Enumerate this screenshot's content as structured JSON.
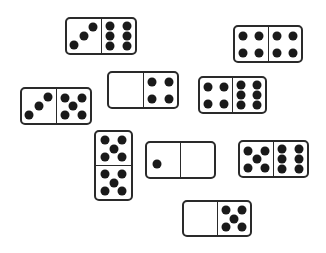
{
  "scene": {
    "description": "Scattered dominoes illustration",
    "ink_color": "#1a1a1a",
    "background": "#ffffff"
  },
  "dominoes": [
    {
      "id": "d1",
      "values": [
        3,
        6
      ],
      "orientation": "h",
      "x": 65,
      "y": 17,
      "w": 72,
      "h": 38
    },
    {
      "id": "d2",
      "values": [
        4,
        4
      ],
      "orientation": "h",
      "x": 233,
      "y": 25,
      "w": 70,
      "h": 38
    },
    {
      "id": "d3",
      "values": [
        0,
        4
      ],
      "orientation": "h",
      "x": 107,
      "y": 71,
      "w": 72,
      "h": 38
    },
    {
      "id": "d4",
      "values": [
        4,
        6
      ],
      "orientation": "h",
      "x": 198,
      "y": 76,
      "w": 69,
      "h": 38
    },
    {
      "id": "d5",
      "values": [
        3,
        5
      ],
      "orientation": "h",
      "x": 20,
      "y": 87,
      "w": 72,
      "h": 38
    },
    {
      "id": "d6",
      "values": [
        5,
        5
      ],
      "orientation": "v",
      "x": 94,
      "y": 130,
      "w": 39,
      "h": 71
    },
    {
      "id": "d7",
      "values": [
        1,
        0
      ],
      "orientation": "h",
      "x": 145,
      "y": 141,
      "w": 71,
      "h": 38
    },
    {
      "id": "d8",
      "values": [
        5,
        6
      ],
      "orientation": "h",
      "x": 238,
      "y": 140,
      "w": 71,
      "h": 38
    },
    {
      "id": "d9",
      "values": [
        0,
        5
      ],
      "orientation": "h",
      "x": 182,
      "y": 200,
      "w": 70,
      "h": 37
    }
  ]
}
